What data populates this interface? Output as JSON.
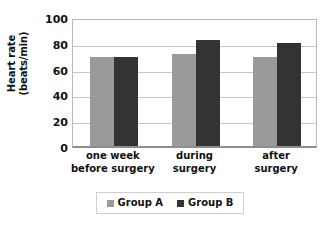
{
  "chart_data": {
    "type": "bar",
    "title": "",
    "xlabel": "",
    "ylabel": "Heart rate (beats/min)",
    "ylabel_line1": "Heart rate",
    "ylabel_line2": "(beats/min)",
    "categories": [
      "one week before surgery",
      "during surgery",
      "after surgery"
    ],
    "category_lines": [
      {
        "line1": "one week",
        "line2": "before surgery"
      },
      {
        "line1": "during",
        "line2": "surgery"
      },
      {
        "line1": "after",
        "line2": "surgery"
      }
    ],
    "series": [
      {
        "name": "Group A",
        "color": "#9a9a9a",
        "values": [
          69,
          71,
          69
        ]
      },
      {
        "name": "Group B",
        "color": "#333333",
        "values": [
          69,
          82,
          80
        ]
      }
    ],
    "ylim": [
      0,
      100
    ],
    "yticks": [
      0,
      20,
      40,
      60,
      80,
      100
    ],
    "ytick_labels": [
      "0",
      "20",
      "40",
      "60",
      "80",
      "100"
    ],
    "grid": true,
    "grid_axis": "y",
    "legend_position": "bottom"
  },
  "legend": {
    "entries": [
      {
        "label": "Group A"
      },
      {
        "label": "Group B"
      }
    ]
  }
}
